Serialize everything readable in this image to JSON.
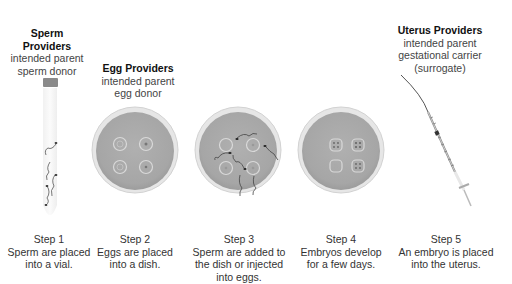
{
  "providers": {
    "sperm": {
      "title": "Sperm Providers",
      "lines": [
        "intended parent",
        "sperm donor"
      ]
    },
    "egg": {
      "title": "Egg Providers",
      "lines": [
        "intended parent",
        "egg donor"
      ]
    },
    "uterus": {
      "title": "Uterus Providers",
      "lines": [
        "intended parent",
        "gestational carrier",
        "(surrogate)"
      ]
    }
  },
  "steps": [
    {
      "label": "Step 1",
      "text": [
        "Sperm are placed",
        "into a vial."
      ],
      "icon": "vial-with-sperm"
    },
    {
      "label": "Step 2",
      "text": [
        "Eggs are placed",
        "into a dish."
      ],
      "icon": "petri-dish-eggs"
    },
    {
      "label": "Step 3",
      "text": [
        "Sperm are added to",
        "the dish or injected",
        "into eggs."
      ],
      "icon": "petri-dish-eggs-sperm"
    },
    {
      "label": "Step 4",
      "text": [
        "Embryos develop",
        "for a few days."
      ],
      "icon": "petri-dish-embryos"
    },
    {
      "label": "Step 5",
      "text": [
        "An embryo is placed",
        "into the uterus."
      ],
      "icon": "syringe-catheter"
    }
  ],
  "colors": {
    "dish": "#a8a8a8",
    "dish_rim": "#e4e4e4",
    "text": "#333333",
    "title": "#111111"
  }
}
